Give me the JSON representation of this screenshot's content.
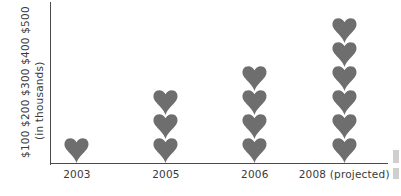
{
  "chart_data": {
    "type": "bar",
    "title": "",
    "subtitle": "",
    "xlabel": "",
    "ylabel": "$100 $200 $300 $400 $500 (in thousands)",
    "ylabel_lines": [
      "$100 $200 $300 $400 $500",
      "(in thousands)"
    ],
    "categories": [
      "2003",
      "2005",
      "2006",
      "2008 (projected)"
    ],
    "values": [
      100,
      300,
      400,
      600
    ],
    "units": "thousands of dollars",
    "icon_values": [
      1,
      3,
      4,
      6
    ],
    "icon": "heart-icon",
    "icon_unit_value": 100,
    "ytick_labels": [
      "$100",
      "$200",
      "$300",
      "$400",
      "$500"
    ],
    "ylim": [
      0,
      600
    ],
    "grid": false,
    "legend": "none"
  },
  "axis": {
    "y_caption_scale": "$100 $200 $300 $400 $500",
    "y_caption_units": "(in thousands)"
  },
  "colors": {
    "icon": "#6e6e6e",
    "axis": "#4a4a4a",
    "text": "#3a3a3a",
    "background": "#ffffff"
  },
  "columns": [
    {
      "label": "2003",
      "count": 1,
      "center_pct": 7.7
    },
    {
      "label": "2005",
      "count": 3,
      "center_pct": 34.1
    },
    {
      "label": "2006",
      "count": 4,
      "center_pct": 60.5
    },
    {
      "label": "2008 (projected)",
      "count": 6,
      "center_pct": 87.0
    }
  ]
}
